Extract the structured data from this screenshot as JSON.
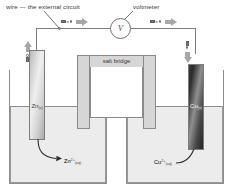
{
  "diagram": {
    "annotations": {
      "wire_label": "wire — the external circuit",
      "voltmeter_label": "voltmeter",
      "voltmeter_symbol": "V",
      "salt_bridge_label": "salt bridge"
    },
    "electrodes": [
      {
        "id": "anode",
        "element": "Zn",
        "state": "(s)",
        "label": "Zn",
        "state_sub": "(s)",
        "appearance": "light-grey-metal",
        "side": "left"
      },
      {
        "id": "cathode",
        "element": "Cu",
        "state": "(s)",
        "label": "Cu",
        "state_sub": "(s)",
        "appearance": "dark-metal",
        "side": "right"
      }
    ],
    "ions": [
      {
        "id": "zinc-ion",
        "formula": "Zn",
        "charge": "2+",
        "state": "(aq)",
        "side": "left"
      },
      {
        "id": "copper-ion",
        "formula": "Cu",
        "charge": "2+",
        "state": "(aq)",
        "side": "right"
      }
    ],
    "electron_flow": [
      {
        "id": "left-vertical",
        "symbol": "e",
        "superscript": "–",
        "direction": "up"
      },
      {
        "id": "top-left",
        "symbol": "e",
        "superscript": "–",
        "direction": "right"
      },
      {
        "id": "top-right",
        "symbol": "e",
        "superscript": "–",
        "direction": "right"
      },
      {
        "id": "right-vertical",
        "symbol": "e",
        "superscript": "–",
        "direction": "down"
      }
    ],
    "colors": {
      "background": "#ffffff",
      "line": "#8a8a8a",
      "solution": "#ececec",
      "salt_bridge_fill": "#d6d6d6",
      "arrow": "#a7a7a7",
      "text": "#3a3a3a",
      "electron_block": "#7a7a7a"
    }
  }
}
